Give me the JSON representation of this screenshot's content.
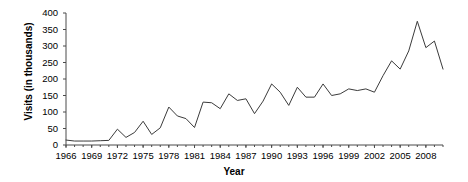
{
  "chart_data": {
    "type": "line",
    "title": "",
    "xlabel": "Year",
    "ylabel": "Visits (in thousands)",
    "xlim": [
      1966,
      2010
    ],
    "ylim": [
      0,
      400
    ],
    "grid": false,
    "legend": "none",
    "y_ticks": [
      0,
      50,
      100,
      150,
      200,
      250,
      300,
      350,
      400
    ],
    "y_tick_labels": [
      "0",
      "50",
      "100",
      "150",
      "200",
      "250",
      "300",
      "350",
      "400"
    ],
    "x_tick_labels": [
      "1966",
      "1969",
      "1972",
      "1975",
      "1978",
      "1981",
      "1984",
      "1987",
      "1990",
      "1993",
      "1996",
      "1999",
      "2002",
      "2005",
      "2008"
    ],
    "x_tick_values": [
      1966,
      1969,
      1972,
      1975,
      1978,
      1981,
      1984,
      1987,
      1990,
      1993,
      1996,
      1999,
      2002,
      2005,
      2008
    ],
    "x_minor_ticks_every": 1,
    "series": [
      {
        "name": "Visits",
        "color": "#3b3b3b",
        "x": [
          1966,
          1967,
          1968,
          1969,
          1970,
          1971,
          1972,
          1973,
          1974,
          1975,
          1976,
          1977,
          1978,
          1979,
          1980,
          1981,
          1982,
          1983,
          1984,
          1985,
          1986,
          1987,
          1988,
          1989,
          1990,
          1991,
          1992,
          1993,
          1994,
          1995,
          1996,
          1997,
          1998,
          1999,
          2000,
          2001,
          2002,
          2003,
          2004,
          2005,
          2006,
          2007,
          2008,
          2009,
          2010
        ],
        "values": [
          15,
          12,
          12,
          12,
          13,
          14,
          48,
          23,
          38,
          72,
          32,
          52,
          115,
          88,
          80,
          53,
          130,
          128,
          110,
          155,
          135,
          140,
          95,
          133,
          185,
          160,
          120,
          175,
          145,
          145,
          185,
          150,
          155,
          170,
          165,
          170,
          160,
          210,
          255,
          230,
          285,
          375,
          295,
          315,
          230
        ]
      }
    ]
  }
}
